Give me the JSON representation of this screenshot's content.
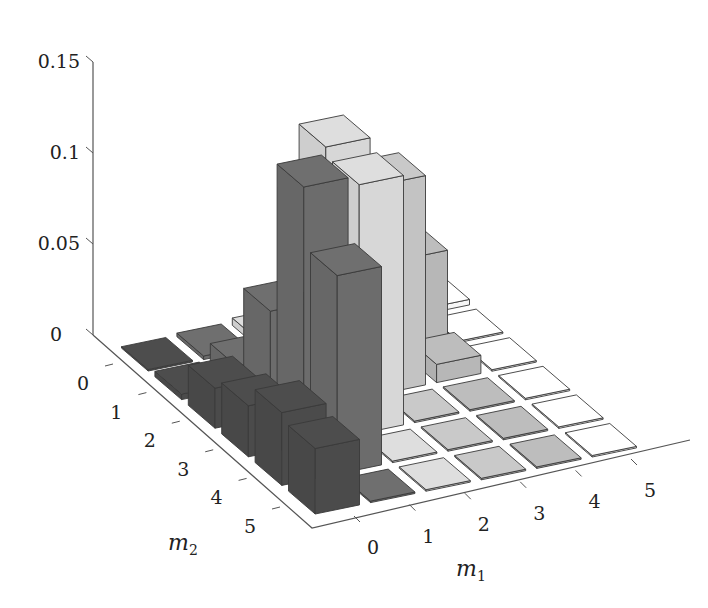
{
  "chart_data": {
    "type": "bar3d",
    "title": "",
    "xlabel": "m1",
    "ylabel": "m2",
    "zlabel": "",
    "x_ticks": [
      "0",
      "1",
      "2",
      "3",
      "4",
      "5"
    ],
    "y_ticks": [
      "0",
      "1",
      "2",
      "3",
      "4",
      "5"
    ],
    "z_ticks": [
      "0",
      "0.05",
      "0.1",
      "0.15"
    ],
    "zlim": [
      0,
      0.15
    ],
    "grid": false,
    "legend": null,
    "column_colors": [
      "#4d4d4d",
      "#6f6f6f",
      "#dedede",
      "#c9c9c9",
      "#bdbdbd",
      "#ffffff"
    ],
    "note": "values[m2][m1], estimated from bar heights",
    "values": [
      [
        0.0,
        0.002,
        0.004,
        0.0,
        0.0,
        0.003
      ],
      [
        0.003,
        0.012,
        0.02,
        0.01,
        0.052,
        0.0
      ],
      [
        0.022,
        0.058,
        0.142,
        0.115,
        0.01,
        0.0
      ],
      [
        0.028,
        0.142,
        0.137,
        0.0,
        0.0,
        0.0
      ],
      [
        0.04,
        0.109,
        0.0,
        0.0,
        0.0,
        0.0
      ],
      [
        0.036,
        0.0,
        0.0,
        0.0,
        0.0,
        0.0
      ]
    ]
  },
  "axes": {
    "z_tick_labels": [
      "0",
      "0.05",
      "0.1",
      "0.15"
    ],
    "m2_tick_labels": [
      "0",
      "1",
      "2",
      "3",
      "4",
      "5"
    ],
    "m1_tick_labels": [
      "0",
      "1",
      "2",
      "3",
      "4",
      "5"
    ],
    "m1_label": "m",
    "m1_sub": "1",
    "m2_label": "m",
    "m2_sub": "2"
  }
}
